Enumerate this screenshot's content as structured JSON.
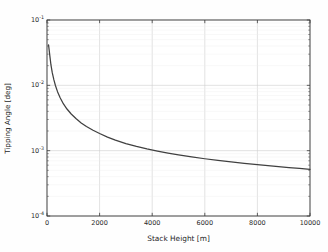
{
  "chart_data": {
    "type": "line",
    "title": "",
    "xlabel": "Stack Height [m]",
    "ylabel": "Tipping Angle [deg]",
    "xscale": "linear",
    "yscale": "log",
    "xlim": [
      0,
      10000
    ],
    "ylim": [
      0.0001,
      0.1
    ],
    "grid": true,
    "legend": null,
    "line_color": "#404040",
    "grid_color": "#cfcfcf",
    "axes_color": "#3c3c3c",
    "background_color": "#ffffff",
    "xticks": [
      0,
      2000,
      4000,
      6000,
      8000,
      10000
    ],
    "xticklabels": [
      "0",
      "2000",
      "4000",
      "6000",
      "8000",
      "10000"
    ],
    "yticks": [
      0.0001,
      0.001,
      0.01,
      0.1
    ],
    "yticklabels": [
      "10⁻⁴",
      "10⁻³",
      "10⁻²",
      "10⁻¹"
    ],
    "yticklabel_parts": [
      {
        "base": "10",
        "exp": "-4"
      },
      {
        "base": "10",
        "exp": "-3"
      },
      {
        "base": "10",
        "exp": "-2"
      },
      {
        "base": "10",
        "exp": "-1"
      }
    ],
    "series": [
      {
        "name": "Tipping Angle",
        "x": [
          60,
          100,
          150,
          200,
          260,
          320,
          400,
          500,
          620,
          760,
          920,
          1100,
          1300,
          1500,
          1750,
          2000,
          2300,
          2600,
          3000,
          3400,
          3800,
          4200,
          4600,
          5000,
          5500,
          6000,
          6500,
          7000,
          7500,
          8000,
          8600,
          9200,
          9600,
          10000
        ],
        "y": [
          0.0415,
          0.03,
          0.0205,
          0.0156,
          0.0122,
          0.00995,
          0.008,
          0.00645,
          0.00523,
          0.00434,
          0.00364,
          0.0031,
          0.00266,
          0.00234,
          0.00205,
          0.00183,
          0.00161,
          0.00145,
          0.001285,
          0.00116,
          0.001063,
          0.000984,
          0.000918,
          0.000862,
          0.000802,
          0.000752,
          0.000709,
          0.000672,
          0.000639,
          0.00061,
          0.000578,
          0.00055,
          0.000534,
          0.000519
        ]
      }
    ],
    "annotations": []
  },
  "axes": {
    "plot_left_px": 47,
    "plot_right_px": 310,
    "plot_top_px": 20,
    "plot_bottom_px": 216
  }
}
